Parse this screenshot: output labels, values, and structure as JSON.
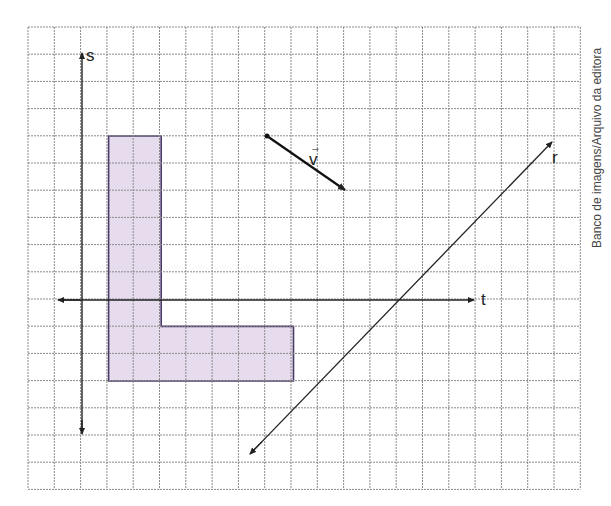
{
  "grid": {
    "x0": 28,
    "y0": 27,
    "cols": 21,
    "rows": 17,
    "cell_w": 26.3,
    "cell_h": 27.2,
    "line_color": "#8a8a8a"
  },
  "axes": {
    "horizontal_label": "t",
    "vertical_label": "s"
  },
  "shape": {
    "name": "L",
    "fill": "#e6dced",
    "stroke": "#4a3a6a"
  },
  "vector": {
    "label": "v",
    "arrow_glyph": "→"
  },
  "line": {
    "label": "r"
  },
  "credit": "Banco de imagens/Arquivo da editora"
}
